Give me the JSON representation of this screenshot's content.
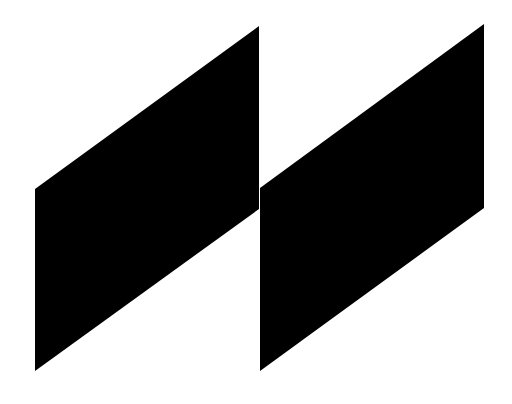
{
  "graphic": {
    "background": "#ffffff",
    "fill": "#000000",
    "shapes": [
      {
        "name": "left-parallelogram",
        "points": "35,189 259,26 259,209 35,371"
      },
      {
        "name": "right-parallelogram",
        "points": "260,188 484,24 484,208 260,371"
      }
    ]
  }
}
